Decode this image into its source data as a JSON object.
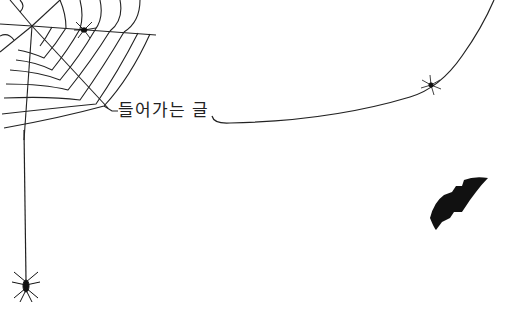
{
  "title": "들어가는 글",
  "colors": {
    "background": "#ffffff",
    "ink": "#222222",
    "bat": "#111111"
  },
  "decorations": [
    {
      "name": "spiderweb",
      "position": "top-left"
    },
    {
      "name": "spider",
      "position": "on-web"
    },
    {
      "name": "hanging-spider",
      "position": "bottom-left"
    },
    {
      "name": "thread-spider",
      "position": "right-thread"
    },
    {
      "name": "bat",
      "position": "right"
    }
  ]
}
